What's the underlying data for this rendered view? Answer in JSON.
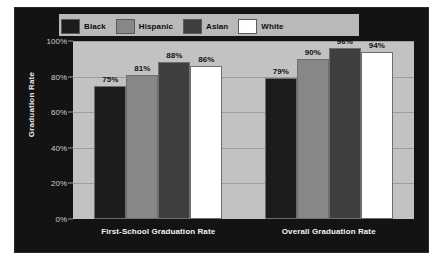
{
  "chart_data": {
    "type": "bar",
    "title": "",
    "xlabel": "",
    "ylabel": "Graduation Rate",
    "ylim": [
      0,
      100
    ],
    "grid": true,
    "legend_position": "top",
    "categories": [
      "First-School Graduation Rate",
      "Overall Graduation Rate"
    ],
    "series": [
      {
        "name": "Black",
        "color": "#1c1c1c",
        "values": [
          75,
          81
        ],
        "labels": [
          "75%",
          "81%"
        ]
      },
      {
        "name": "Hispanic",
        "color": "#878787",
        "values": [
          81,
          90
        ],
        "labels": [
          "81%",
          "90%"
        ]
      },
      {
        "name": "Asian",
        "color": "#3f3f3f",
        "values": [
          88,
          96
        ],
        "labels": [
          "88%",
          "96%"
        ]
      },
      {
        "name": "White",
        "color": "#ffffff",
        "values": [
          86,
          94
        ],
        "labels": [
          "86%",
          "94%"
        ]
      }
    ],
    "groups": [
      {
        "category": "First-School Graduation Rate",
        "bars": [
          {
            "series": "Black",
            "value": 75,
            "label": "75%",
            "color": "#1c1c1c"
          },
          {
            "series": "Hispanic",
            "value": 81,
            "label": "81%",
            "color": "#878787"
          },
          {
            "series": "Asian",
            "value": 88,
            "label": "88%",
            "color": "#3f3f3f"
          },
          {
            "series": "White",
            "value": 86,
            "label": "86%",
            "color": "#ffffff"
          }
        ]
      },
      {
        "category": "Overall Graduation Rate",
        "bars": [
          {
            "series": "Black",
            "value": 79,
            "label": "79%",
            "color": "#1c1c1c"
          },
          {
            "series": "Hispanic",
            "value": 90,
            "label": "90%",
            "color": "#878787"
          },
          {
            "series": "Asian",
            "value": 96,
            "label": "96%",
            "color": "#3f3f3f"
          },
          {
            "series": "White",
            "value": 94,
            "label": "94%",
            "color": "#ffffff"
          }
        ]
      }
    ],
    "y_ticks": [
      {
        "value": 100,
        "label": "100%"
      },
      {
        "value": 80,
        "label": "80%"
      },
      {
        "value": 60,
        "label": "60%"
      },
      {
        "value": 40,
        "label": "40%"
      },
      {
        "value": 20,
        "label": "20%"
      },
      {
        "value": 0,
        "label": "0%"
      }
    ]
  },
  "legend": {
    "items": [
      {
        "label": "Black",
        "color": "#1c1c1c"
      },
      {
        "label": "Hispanic",
        "color": "#878787"
      },
      {
        "label": "Asian",
        "color": "#3f3f3f"
      },
      {
        "label": "White",
        "color": "#ffffff"
      }
    ]
  },
  "axis": {
    "y_title": "Graduation Rate"
  },
  "colors": {
    "frame_background": "#131313",
    "plot_background": "#c2c2c2",
    "gridline": "#9d9d9d",
    "tick_text": "#cfcfcf",
    "x_label_text": "#f2f2f2",
    "value_label_text": "#111111"
  }
}
